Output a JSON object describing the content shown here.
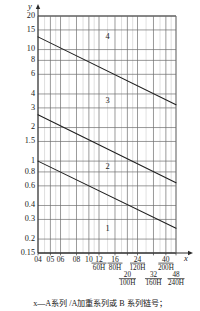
{
  "figure": {
    "y_axis_name": "y",
    "x_axis_name": "x",
    "caption": "x—A系列 /A加重系列或 B 系列链号；"
  },
  "chart_data": {
    "type": "line",
    "title": "",
    "subtitle": "",
    "xlabel": "x",
    "ylabel": "y",
    "xscale": "log",
    "yscale": "log",
    "grid": true,
    "legend": "none",
    "ylim": [
      0.15,
      20
    ],
    "xlim": [
      4,
      48
    ],
    "ytick_labels": [
      "20",
      "15",
      "10",
      "8",
      "6",
      "4",
      "3",
      "2",
      "1.5",
      "1",
      "0.8",
      "0.6",
      "0.4",
      "0.3",
      "0.2",
      "0.15"
    ],
    "ytick_values": [
      20,
      15,
      10,
      8,
      6,
      4,
      3,
      2,
      1.5,
      1,
      0.8,
      0.6,
      0.4,
      0.3,
      0.2,
      0.15
    ],
    "xtick_labels_row1": [
      "04",
      "05",
      "06",
      "08",
      "10",
      "12",
      "16",
      "24",
      "40"
    ],
    "xtick_values_row1": [
      4,
      5,
      6,
      8,
      10,
      12,
      16,
      24,
      40
    ],
    "xtick_labels_row2": [
      "20",
      "32",
      "48"
    ],
    "xtick_values_row2": [
      20,
      32,
      48
    ],
    "xtick_sublabels_row1": [
      "",
      "",
      "",
      "",
      "",
      "60H",
      "80H",
      "120H",
      "200H"
    ],
    "xtick_sublabels_row2": [
      "100H",
      "160H",
      "240H"
    ],
    "annotations": [
      {
        "label": "4",
        "x": 14,
        "y": 13.0
      },
      {
        "label": "3",
        "x": 14,
        "y": 3.45
      },
      {
        "label": "2",
        "x": 14,
        "y": 0.88
      },
      {
        "label": "1",
        "x": 14,
        "y": 0.245
      }
    ],
    "series": [
      {
        "name": "boundary-3-4",
        "x": [
          4,
          48
        ],
        "values": [
          13.0,
          3.2
        ]
      },
      {
        "name": "boundary-2-3",
        "x": [
          4,
          48
        ],
        "values": [
          2.6,
          0.64
        ]
      },
      {
        "name": "boundary-1-2",
        "x": [
          4,
          48
        ],
        "values": [
          1.0,
          0.25
        ]
      }
    ]
  }
}
